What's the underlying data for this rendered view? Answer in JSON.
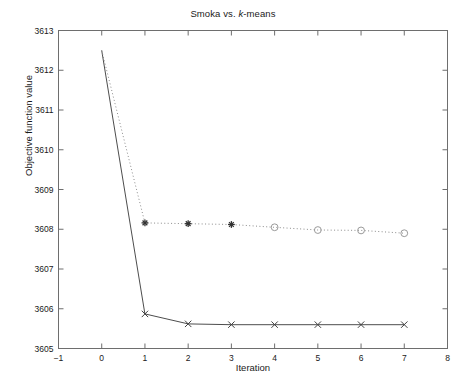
{
  "chart_data": {
    "type": "line",
    "title_prefix": "Smoka vs. ",
    "title_italic": "k",
    "title_suffix": "-means",
    "title": "Smoka vs. k-means",
    "xlabel": "Iteration",
    "ylabel": "Objective function value",
    "xlim": [
      -1,
      8
    ],
    "ylim": [
      3605,
      3613
    ],
    "xticks": [
      -1,
      0,
      1,
      2,
      3,
      4,
      5,
      6,
      7,
      8
    ],
    "yticks": [
      3605,
      3606,
      3607,
      3608,
      3609,
      3610,
      3611,
      3612,
      3613
    ],
    "grid": false,
    "legend": "none",
    "series": [
      {
        "name": "Smoka",
        "style": "solid",
        "color": "#4d4d4d",
        "marker": "x",
        "x": [
          0,
          1,
          2,
          3,
          4,
          5,
          6,
          7
        ],
        "values": [
          3612.5,
          3605.87,
          3605.62,
          3605.6,
          3605.6,
          3605.6,
          3605.6,
          3605.6
        ]
      },
      {
        "name": "k-means",
        "style": "dotted",
        "color": "#8c8c8c",
        "marker": "star-then-circle",
        "marker_switch_index": 4,
        "x": [
          0,
          1,
          2,
          3,
          4,
          5,
          6,
          7
        ],
        "values": [
          3612.5,
          3608.16,
          3608.14,
          3608.12,
          3608.05,
          3607.98,
          3607.97,
          3607.9
        ]
      }
    ]
  }
}
